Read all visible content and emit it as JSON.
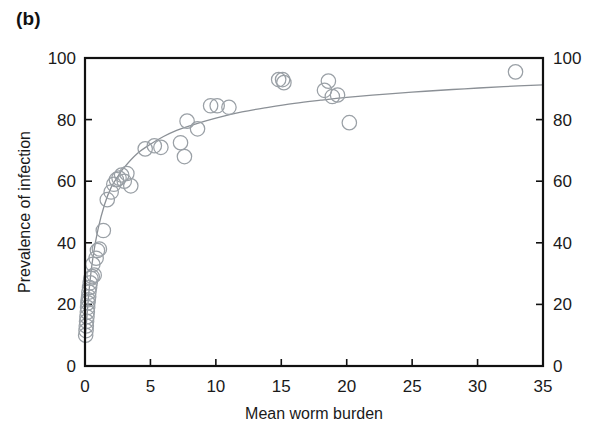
{
  "figure": {
    "panel_label": "(b)",
    "background_color": "#ffffff",
    "marker_color": "#9aa0a6",
    "curve_color": "#8b9096",
    "axis_color": "#111111"
  },
  "chart_data": {
    "type": "scatter",
    "title": "",
    "xlabel": "Mean worm burden",
    "ylabel": "Prevalence of infection",
    "ylabel_right": "",
    "xlim": [
      0,
      35
    ],
    "ylim": [
      0,
      100
    ],
    "xticks": [
      0,
      5,
      10,
      15,
      20,
      25,
      30,
      35
    ],
    "yticks": [
      0,
      20,
      40,
      60,
      80,
      100
    ],
    "yticks_right": [
      0,
      20,
      40,
      60,
      80,
      100
    ],
    "grid": false,
    "legend": null,
    "marker_shape": "open-circle",
    "points": [
      [
        0.05,
        10.0
      ],
      [
        0.08,
        11.5
      ],
      [
        0.1,
        13.0
      ],
      [
        0.12,
        14.5
      ],
      [
        0.15,
        16.0
      ],
      [
        0.18,
        17.5
      ],
      [
        0.2,
        19.0
      ],
      [
        0.22,
        20.5
      ],
      [
        0.25,
        21.5
      ],
      [
        0.28,
        22.5
      ],
      [
        0.3,
        24.0
      ],
      [
        0.35,
        25.5
      ],
      [
        0.4,
        27.0
      ],
      [
        0.45,
        28.5
      ],
      [
        0.55,
        29.0
      ],
      [
        0.7,
        29.5
      ],
      [
        0.6,
        33.0
      ],
      [
        0.85,
        35.0
      ],
      [
        0.95,
        37.5
      ],
      [
        1.1,
        38.0
      ],
      [
        1.4,
        44.0
      ],
      [
        1.7,
        54.0
      ],
      [
        2.0,
        56.5
      ],
      [
        2.2,
        59.0
      ],
      [
        2.4,
        60.5
      ],
      [
        2.6,
        61.0
      ],
      [
        2.8,
        62.0
      ],
      [
        3.0,
        60.0
      ],
      [
        3.2,
        62.5
      ],
      [
        3.5,
        58.5
      ],
      [
        4.6,
        70.5
      ],
      [
        5.3,
        71.5
      ],
      [
        5.8,
        71.0
      ],
      [
        7.3,
        72.5
      ],
      [
        7.6,
        68.0
      ],
      [
        7.8,
        79.5
      ],
      [
        8.6,
        77.0
      ],
      [
        9.6,
        84.5
      ],
      [
        10.1,
        84.5
      ],
      [
        11.0,
        84.0
      ],
      [
        14.8,
        93.0
      ],
      [
        15.1,
        93.0
      ],
      [
        15.2,
        92.0
      ],
      [
        18.3,
        89.5
      ],
      [
        18.6,
        92.5
      ],
      [
        18.9,
        87.5
      ],
      [
        19.3,
        88.0
      ],
      [
        20.2,
        79.0
      ],
      [
        32.9,
        95.5
      ]
    ],
    "fit_curve": {
      "description": "monotonic saturating fit",
      "x": [
        0.0,
        0.3,
        0.6,
        1.0,
        1.5,
        2.0,
        2.5,
        3.0,
        4.0,
        5.0,
        6.0,
        7.0,
        8.0,
        10.0,
        12.0,
        14.0,
        16.0,
        18.0,
        20.0,
        23.0,
        26.0,
        29.0,
        32.0,
        35.0
      ],
      "y": [
        8.0,
        24.0,
        35.0,
        44.5,
        52.5,
        58.0,
        61.5,
        64.5,
        69.0,
        72.0,
        74.5,
        76.5,
        78.0,
        80.5,
        82.5,
        84.0,
        85.3,
        86.3,
        87.2,
        88.3,
        89.2,
        90.0,
        90.7,
        91.3
      ]
    }
  }
}
